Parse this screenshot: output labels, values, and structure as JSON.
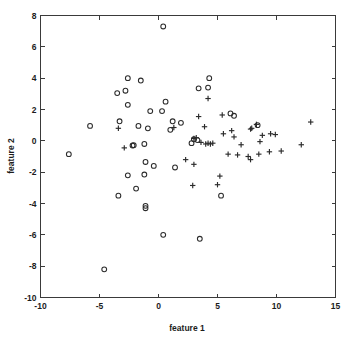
{
  "chart_data": {
    "type": "scatter",
    "title": "",
    "xlabel": "feature 1",
    "ylabel": "feature 2",
    "xlim": [
      -10,
      15
    ],
    "ylim": [
      -10,
      8
    ],
    "xticks": [
      -10,
      -5,
      0,
      5,
      10,
      15
    ],
    "yticks": [
      -10,
      -8,
      -6,
      -4,
      -2,
      0,
      2,
      4,
      6,
      8
    ],
    "xticklabels": [
      "-10",
      "-5",
      "0",
      "5",
      "10",
      "15"
    ],
    "yticklabels": [
      "-10",
      "-8",
      "-6",
      "-4",
      "-2",
      "0",
      "2",
      "4",
      "6",
      "8"
    ],
    "grid": false,
    "legend": null,
    "marker_color": "#2b2b2b",
    "series": [
      {
        "name": "class-circle",
        "marker": "o",
        "points": [
          [
            0.4,
            7.3
          ],
          [
            -2.6,
            4.0
          ],
          [
            -1.5,
            3.85
          ],
          [
            -3.5,
            3.05
          ],
          [
            -2.8,
            3.2
          ],
          [
            3.4,
            3.35
          ],
          [
            4.3,
            4.0
          ],
          [
            4.2,
            3.4
          ],
          [
            -2.6,
            2.3
          ],
          [
            0.6,
            2.5
          ],
          [
            -0.7,
            1.9
          ],
          [
            0.3,
            1.9
          ],
          [
            6.1,
            1.75
          ],
          [
            6.4,
            1.6
          ],
          [
            -5.8,
            0.95
          ],
          [
            -3.3,
            1.25
          ],
          [
            -1.7,
            0.95
          ],
          [
            -0.9,
            0.8
          ],
          [
            1.2,
            1.25
          ],
          [
            1.9,
            1.15
          ],
          [
            1.0,
            0.7
          ],
          [
            8.4,
            1.0
          ],
          [
            -7.6,
            -0.85
          ],
          [
            -2.2,
            -0.3
          ],
          [
            -2.1,
            -0.28
          ],
          [
            -1.2,
            -0.2
          ],
          [
            2.8,
            -0.15
          ],
          [
            3.3,
            0.05
          ],
          [
            3.0,
            0.1
          ],
          [
            -1.1,
            -1.35
          ],
          [
            -0.4,
            -1.6
          ],
          [
            1.4,
            -1.7
          ],
          [
            -2.6,
            -2.2
          ],
          [
            -1.2,
            -2.15
          ],
          [
            -1.9,
            -3.05
          ],
          [
            -3.4,
            -3.5
          ],
          [
            5.3,
            -3.5
          ],
          [
            -1.1,
            -4.15
          ],
          [
            -1.1,
            -4.3
          ],
          [
            0.4,
            -6.0
          ],
          [
            3.5,
            -6.25
          ],
          [
            -4.6,
            -8.2
          ]
        ]
      },
      {
        "name": "class-plus",
        "marker": "+",
        "points": [
          [
            4.2,
            2.7
          ],
          [
            3.4,
            1.55
          ],
          [
            5.4,
            1.65
          ],
          [
            -3.4,
            0.8
          ],
          [
            1.3,
            0.85
          ],
          [
            12.9,
            1.2
          ],
          [
            8.3,
            1.05
          ],
          [
            3.9,
            0.9
          ],
          [
            6.2,
            0.65
          ],
          [
            7.8,
            0.75
          ],
          [
            7.9,
            0.8
          ],
          [
            3.0,
            0.15
          ],
          [
            3.2,
            0.2
          ],
          [
            5.5,
            0.45
          ],
          [
            6.4,
            0.25
          ],
          [
            8.8,
            0.35
          ],
          [
            9.5,
            0.45
          ],
          [
            9.9,
            0.4
          ],
          [
            -2.9,
            -0.45
          ],
          [
            3.6,
            -0.1
          ],
          [
            4.2,
            -0.15
          ],
          [
            4.4,
            -0.2
          ],
          [
            4.6,
            -0.15
          ],
          [
            4.0,
            -0.2
          ],
          [
            8.6,
            -0.05
          ],
          [
            7.0,
            -0.25
          ],
          [
            5.9,
            -0.85
          ],
          [
            6.7,
            -0.9
          ],
          [
            7.6,
            -1.0
          ],
          [
            7.8,
            -1.2
          ],
          [
            8.5,
            -0.85
          ],
          [
            9.4,
            -0.7
          ],
          [
            10.4,
            -0.65
          ],
          [
            12.1,
            -0.25
          ],
          [
            2.3,
            -1.2
          ],
          [
            3.0,
            -1.5
          ],
          [
            5.2,
            -2.25
          ],
          [
            5.0,
            -2.8
          ],
          [
            2.9,
            -2.85
          ]
        ]
      }
    ]
  },
  "axes": {
    "xlabel": "feature 1",
    "ylabel": "feature 2"
  }
}
